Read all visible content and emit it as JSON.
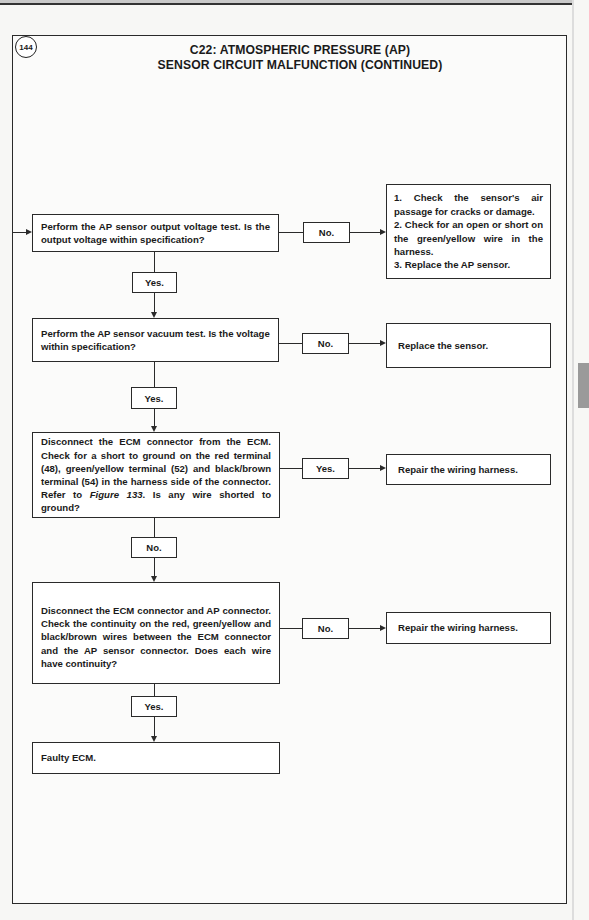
{
  "page": {
    "figure_number": "144",
    "title_line1": "C22: ATMOSPHERIC PRESSURE (AP)",
    "title_line2": "SENSOR CIRCUIT MALFUNCTION (CONTINUED)"
  },
  "flowchart": {
    "steps": [
      {
        "text": "Perform the  AP sensor output voltage test. Is the output voltage within specification?",
        "branch_right_label": "No.",
        "branch_right_result": "1. Check the sensor's air passage for cracks or damage. 2. Check for an open or short on the green/yellow wire in the harness. 3. Replace the AP sensor.",
        "branch_right_result_lines": [
          "1. Check the sensor's air passage for cracks or damage.",
          "2. Check for an open or short on the green/yellow wire in the harness.",
          "3. Replace the AP sensor."
        ],
        "branch_down_label": "Yes."
      },
      {
        "text": "Perform the AP sensor vacuum test. Is the voltage within specification?",
        "branch_right_label": "No.",
        "branch_right_result": "Replace the sensor.",
        "branch_down_label": "Yes."
      },
      {
        "text_before_ref": "Disconnect the ECM connector from the ECM. Check for a short to ground on the red terminal (48), green/yellow terminal (52) and black/brown terminal (54) in the harness side of the connector. Refer to ",
        "text_ref": "Figure 133",
        "text_after_ref": ". Is any wire shorted to ground?",
        "branch_right_label": "Yes.",
        "branch_right_result": "Repair the wiring harness.",
        "branch_down_label": "No."
      },
      {
        "text": "Disconnect the ECM connector and AP connector. Check the continuity on the red, green/yellow and black/brown wires between the ECM connector and the AP sensor connector. Does each wire have continuity?",
        "branch_right_label": "No.",
        "branch_right_result": "Repair the wiring harness.",
        "branch_down_label": "Yes."
      },
      {
        "text": "Faulty ECM."
      }
    ]
  }
}
